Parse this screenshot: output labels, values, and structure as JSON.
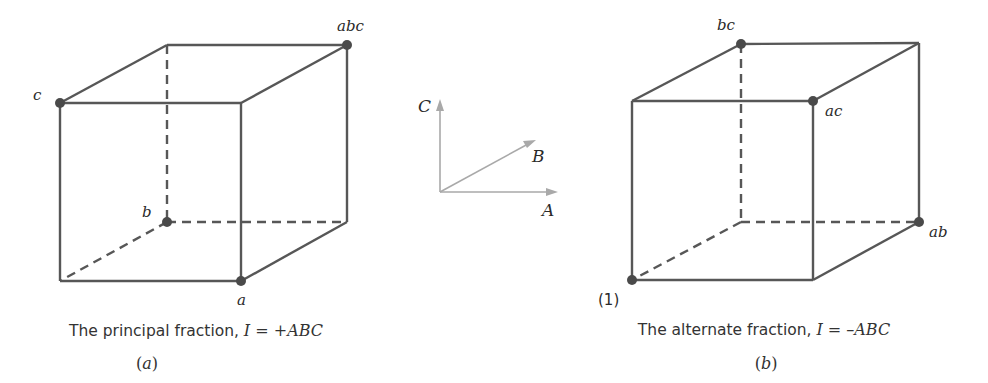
{
  "figure": {
    "panels": [
      {
        "id": "a",
        "sublabel_open": "(",
        "sublabel_letter": "a",
        "sublabel_close": ")",
        "caption_prefix": "The principal fraction, ",
        "caption_math": "I = +ABC",
        "vertex_labels": {
          "c": "c",
          "abc": "abc",
          "b": "b",
          "a": "a"
        }
      },
      {
        "id": "b",
        "sublabel_open": "(",
        "sublabel_letter": "b",
        "sublabel_close": ")",
        "caption_prefix": "The alternate fraction, ",
        "caption_math": "I = –ABC",
        "vertex_labels": {
          "bc": "bc",
          "ac": "ac",
          "ab": "ab",
          "one": "(1)"
        }
      }
    ],
    "axes": {
      "A": "A",
      "B": "B",
      "C": "C"
    },
    "colors": {
      "edge": "#575757",
      "vertex": "#4a4a4a",
      "axis": "#a9a9a9",
      "text": "#333333"
    }
  }
}
